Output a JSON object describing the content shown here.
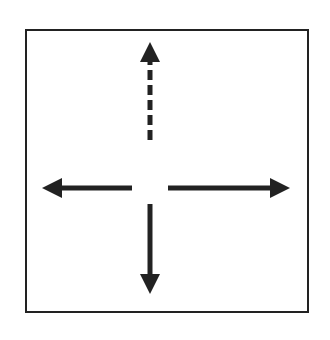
{
  "files": [
    "a",
    "b",
    "c",
    "d",
    "e",
    "f",
    "g",
    "h"
  ],
  "ranks": [
    "8",
    "7",
    "6",
    "5",
    "4",
    "3",
    "2",
    "1"
  ],
  "pieces": [
    {
      "square": "d4",
      "type": "rook",
      "color": "black",
      "glyph": "♜"
    },
    {
      "square": "d5",
      "type": "pawn",
      "color": "black",
      "glyph": "♟"
    },
    {
      "square": "e3",
      "type": "bishop",
      "color": "black",
      "glyph": "♝"
    }
  ],
  "highlighted_squares": [
    "d5",
    "d4",
    "e3"
  ],
  "arrows": [
    {
      "from": "d4",
      "to": "d8",
      "style": "dashed",
      "meaning": "blocked path"
    },
    {
      "from": "d4",
      "to": "d1",
      "style": "solid"
    },
    {
      "from": "d4",
      "to": "a4",
      "style": "solid"
    },
    {
      "from": "d4",
      "to": "h4",
      "style": "solid"
    }
  ],
  "colors": {
    "line": "#222222",
    "hatch": "#999999"
  }
}
